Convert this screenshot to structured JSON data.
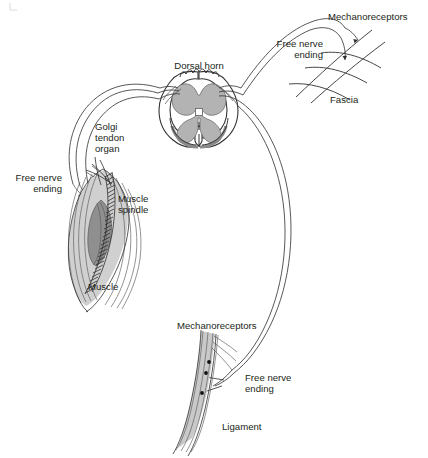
{
  "figure": {
    "type": "anatomical-diagram",
    "background_color": "#ffffff",
    "text_color": "#231f20"
  },
  "labels": {
    "dorsal_horn": "Dorsal horn",
    "golgi_tendon_organ_line1": "Golgi",
    "golgi_tendon_organ_line2": "tendon",
    "golgi_tendon_organ_line3": "organ",
    "free_nerve_ending_muscle_line1": "Free nerve",
    "free_nerve_ending_muscle_line2": "ending",
    "muscle_spindle_line1": "Muscle",
    "muscle_spindle_line2": "spindle",
    "muscle": "Muscle",
    "mechanoreceptors_fascia": "Mechanoreceptors",
    "free_nerve_ending_fascia_line1": "Free nerve",
    "free_nerve_ending_fascia_line2": "ending",
    "fascia": "Fascia",
    "mechanoreceptors_ligament": "Mechanoreceptors",
    "free_nerve_ending_ligament_line1": "Free nerve",
    "free_nerve_ending_ligament_line2": "ending",
    "ligament": "Ligament"
  },
  "structures": {
    "spinal_cord": {
      "name": "spinal-cord-cross-section",
      "white_matter_color": "#ffffff",
      "gray_matter_color": "#b3b3b3",
      "outline_color": "#333333"
    },
    "muscle": {
      "name": "muscle-belly",
      "fill_color": "#cccccc",
      "spindle_fill_color": "#8f8f8f"
    },
    "fascia": {
      "name": "fascia-crosshatch",
      "stroke_color": "#3c3c3c"
    },
    "ligament": {
      "name": "ligament-band",
      "fill_color": "#c9c9c9",
      "receptor_dot_color": "#111111",
      "receptor_dot_count": 3
    },
    "nerve_pathways": {
      "name": "afferent-nerve-fibers",
      "stroke_color": "#3a3a3a",
      "muscle_branch_fiber_count": 3,
      "fascia_branch_fiber_count": 2,
      "ligament_branch_fiber_count": 2
    }
  }
}
